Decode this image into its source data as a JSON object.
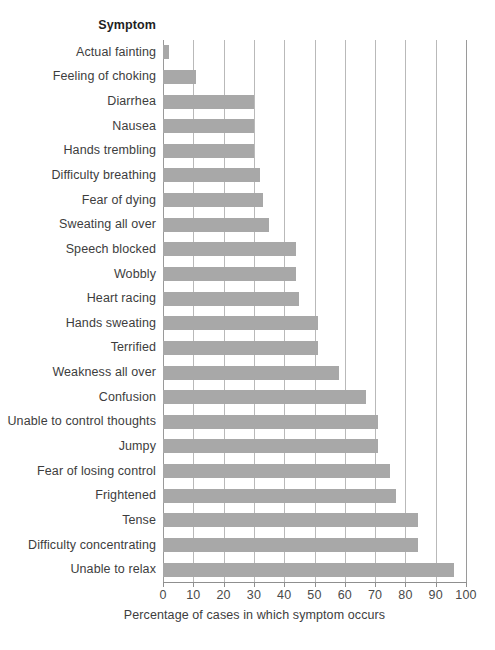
{
  "chart_data": {
    "type": "bar",
    "orientation": "horizontal",
    "title": "",
    "subtitle": "",
    "xlabel": "Percentage of cases in which symptom occurs",
    "ylabel": "Symptom",
    "categories": [
      "Actual fainting",
      "Feeling of choking",
      "Diarrhea",
      "Nausea",
      "Hands trembling",
      "Difficulty breathing",
      "Fear of dying",
      "Sweating all over",
      "Speech blocked",
      "Wobbly",
      "Heart racing",
      "Hands sweating",
      "Terrified",
      "Weakness all over",
      "Confusion",
      "Unable to control thoughts",
      "Jumpy",
      "Fear of losing control",
      "Frightened",
      "Tense",
      "Difficulty concentrating",
      "Unable to relax"
    ],
    "values": [
      2,
      11,
      30,
      30,
      30,
      32,
      33,
      35,
      44,
      44,
      45,
      51,
      51,
      58,
      67,
      71,
      71,
      75,
      77,
      84,
      84,
      96
    ],
    "xlim": [
      0,
      100
    ],
    "xticks": [
      0,
      10,
      20,
      30,
      40,
      50,
      60,
      70,
      80,
      90,
      100
    ],
    "xtick_labels": [
      "0",
      "10",
      "20",
      "30",
      "40",
      "50",
      "60",
      "70",
      "80",
      "90",
      "100"
    ],
    "grid": "vertical",
    "legend": "none",
    "bar_color": "#a8a8a8",
    "grid_color": "#b9b9b9",
    "axis_color": "#8f8f8f",
    "background_color": "#ffffff",
    "text_color": "#3d3d3d"
  },
  "header": {
    "column_title": "Symptom"
  },
  "axis": {
    "x_title": "Percentage of cases in which symptom occurs"
  }
}
